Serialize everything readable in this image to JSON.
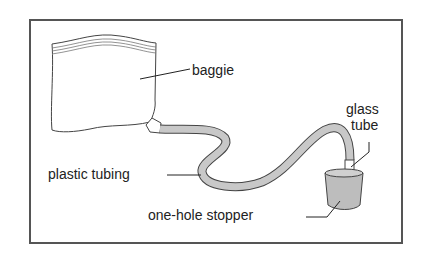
{
  "diagram": {
    "labels": {
      "baggie": "baggie",
      "glass_tube_line1": "glass",
      "glass_tube_line2": "tube",
      "plastic_tubing": "plastic tubing",
      "stopper": "one-hole stopper"
    },
    "colors": {
      "frame": "#555555",
      "outline": "#444444",
      "tubing_fill": "#c8c8c8",
      "stopper_fill": "#bdbdbd",
      "glass_fill": "#ffffff"
    }
  }
}
